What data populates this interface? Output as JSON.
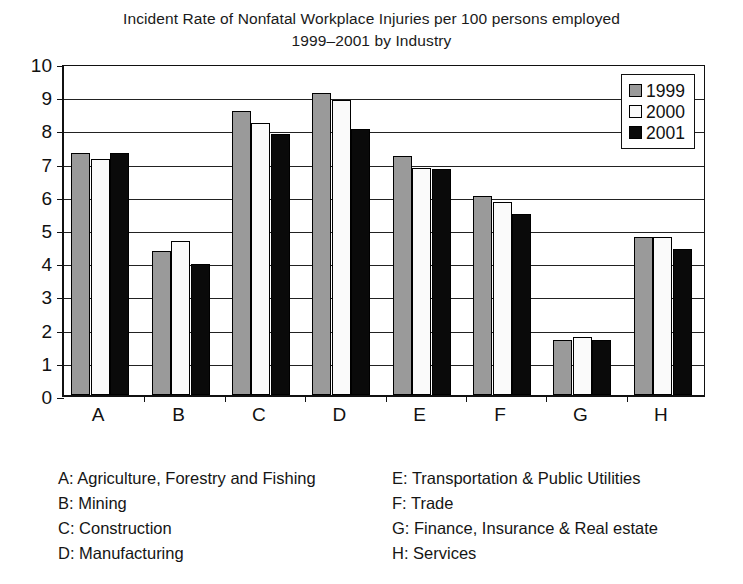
{
  "chart_data": {
    "type": "bar",
    "title": "Incident Rate of Nonfatal Workplace Injuries per 100 persons employed 1999–2001 by Industry",
    "title_line1": "Incident Rate of Nonfatal Workplace Injuries per 100 persons employed",
    "title_line2": "1999–2001 by Industry",
    "xlabel": "",
    "ylabel": "",
    "categories": [
      "A",
      "B",
      "C",
      "D",
      "E",
      "F",
      "G",
      "H"
    ],
    "ylim": [
      0,
      10
    ],
    "yticks": [
      0,
      1,
      2,
      3,
      4,
      5,
      6,
      7,
      8,
      9,
      10
    ],
    "grid": true,
    "legend_position": "top-right",
    "series": [
      {
        "name": "1999",
        "color": "#9a9a9a",
        "values": [
          7.3,
          4.35,
          8.55,
          9.1,
          7.2,
          6.0,
          1.65,
          4.75
        ]
      },
      {
        "name": "2000",
        "color": "#fafafa",
        "values": [
          7.1,
          4.65,
          8.2,
          8.9,
          6.85,
          5.8,
          1.75,
          4.75
        ]
      },
      {
        "name": "2001",
        "color": "#0a0a0a",
        "values": [
          7.3,
          3.95,
          7.85,
          8.0,
          6.8,
          5.45,
          1.65,
          4.4
        ]
      }
    ],
    "category_legend": {
      "left_column": [
        "A: Agriculture, Forestry and Fishing",
        "B: Mining",
        "C: Construction",
        "D: Manufacturing"
      ],
      "right_column": [
        "E: Transportation & Public Utilities",
        "F: Trade",
        "G: Finance, Insurance & Real estate",
        "H: Services"
      ]
    }
  }
}
